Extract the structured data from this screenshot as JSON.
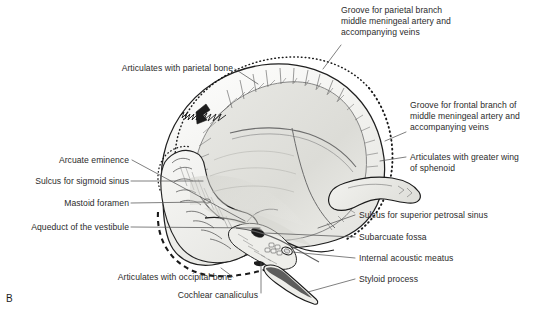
{
  "figure": {
    "panel_letter": "B",
    "caption_label": "B",
    "colors": {
      "ink": "#2b2b2b",
      "line": "#555555",
      "bone_outline": "#1a1a1a",
      "bone_fill_light": "#f4f4f2",
      "bone_fill_mid": "#e2e2de",
      "bone_fill_shadow": "#cfcfca",
      "background": "#ffffff"
    }
  },
  "labels": [
    {
      "id": "groove-parietal-branch",
      "align": "left",
      "x": 341,
      "y": 5,
      "lines": [
        "Groove for parietal branch",
        "middle meningeal artery and",
        "accompanying veins"
      ],
      "text": "Groove for parietal branch\nmiddle meningeal artery and\naccompanying veins"
    },
    {
      "id": "articulates-parietal-bone",
      "align": "right",
      "x": 83,
      "y": 63,
      "lines": [
        "Articulates with parietal bone"
      ],
      "text": "Articulates with parietal bone"
    },
    {
      "id": "groove-frontal-branch",
      "align": "left",
      "x": 410,
      "y": 100,
      "lines": [
        "Groove for frontal branch of",
        "middle meningeal artery and",
        "accompanying veins"
      ],
      "text": "Groove for frontal branch of\nmiddle meningeal artery and\naccompanying veins"
    },
    {
      "id": "articulates-greater-wing-sphenoid",
      "align": "left",
      "x": 410,
      "y": 152,
      "lines": [
        "Articulates with greater wing",
        "of sphenoid"
      ],
      "text": "Articulates with greater wing\nof sphenoid"
    },
    {
      "id": "arcuate-eminence",
      "align": "right",
      "x": 47,
      "y": 155,
      "lines": [
        "Arcuate eminence"
      ],
      "text": "Arcuate eminence"
    },
    {
      "id": "sulcus-sigmoid-sinus",
      "align": "right",
      "x": 20,
      "y": 177,
      "lines": [
        "Sulcus for sigmoid sinus"
      ],
      "text": "Sulcus for sigmoid sinus"
    },
    {
      "id": "mastoid-foramen",
      "align": "right",
      "x": 54,
      "y": 199,
      "lines": [
        "Mastoid foramen"
      ],
      "text": "Mastoid foramen"
    },
    {
      "id": "aqueduct-of-the-vestibule",
      "align": "right",
      "x": 13,
      "y": 223,
      "lines": [
        "Aqueduct of the vestibule"
      ],
      "text": "Aqueduct of the vestibule"
    },
    {
      "id": "sulcus-superior-petrosal-sinus",
      "align": "left",
      "x": 359,
      "y": 211,
      "lines": [
        "Sulcus for superior petrosal sinus"
      ],
      "text": "Sulcus for superior petrosal sinus"
    },
    {
      "id": "subarcuate-fossa",
      "align": "left",
      "x": 359,
      "y": 233,
      "lines": [
        "Subarcuate fossa"
      ],
      "text": "Subarcuate fossa"
    },
    {
      "id": "internal-acoustic-meatus",
      "align": "left",
      "x": 359,
      "y": 254,
      "lines": [
        "Internal acoustic meatus"
      ],
      "text": "Internal acoustic meatus"
    },
    {
      "id": "styloid-process",
      "align": "left",
      "x": 359,
      "y": 275,
      "lines": [
        "Styloid process"
      ],
      "text": "Styloid process"
    },
    {
      "id": "articulates-occipital-bone",
      "align": "right",
      "x": 83,
      "y": 274,
      "lines": [
        "Articulates with occipital bone"
      ],
      "text": "Articulates with occipital bone"
    },
    {
      "id": "cochlear-canaliculus",
      "align": "right",
      "x": 170,
      "y": 295,
      "lines": [
        "Cochlear canaliculus"
      ],
      "text": "Cochlear canaliculus"
    }
  ],
  "anatomy": {
    "view": "Temporal bone, internal (cerebral) surface",
    "structures": [
      "squamous part of temporal bone",
      "petrous part",
      "mastoid part",
      "zygomatic process",
      "styloid process",
      "internal acoustic meatus",
      "subarcuate fossa",
      "arcuate eminence",
      "sulcus for sigmoid sinus",
      "sulcus for superior petrosal sinus",
      "mastoid foramen",
      "aqueduct of the vestibule",
      "cochlear canaliculus"
    ]
  }
}
